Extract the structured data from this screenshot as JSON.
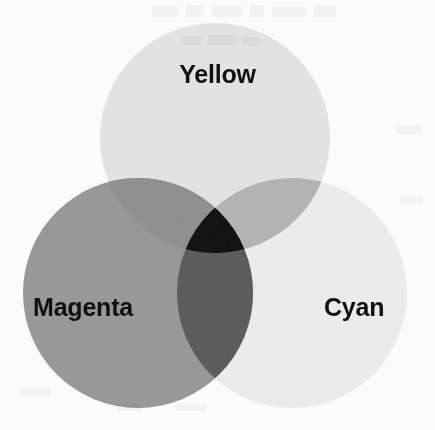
{
  "figure": {
    "type": "venn-diagram",
    "background_color": "#fbfbfb",
    "label_color": "#111111"
  },
  "labels": {
    "yellow": "Yellow",
    "magenta": "Magenta",
    "cyan": "Cyan"
  },
  "chart_data": {
    "type": "venn",
    "title": "",
    "subtitle": "",
    "xlabel": "",
    "ylabel": "",
    "grid": false,
    "legend_position": "in-figure",
    "rendering": "grayscale scan of a color figure",
    "sets": [
      {
        "id": "yellow",
        "label": "Yellow",
        "fill": "#e3e3e3",
        "center_x": 215,
        "center_y": 138,
        "radius": 115,
        "label_x": 217,
        "label_y": 74
      },
      {
        "id": "magenta",
        "label": "Magenta",
        "fill": "#989898",
        "center_x": 138,
        "center_y": 293,
        "radius": 115,
        "label_x": 95,
        "label_y": 307
      },
      {
        "id": "cyan",
        "label": "Cyan",
        "fill": "#ececec",
        "center_x": 292,
        "center_y": 293,
        "radius": 115,
        "label_x": 362,
        "label_y": 307
      }
    ],
    "regions": [
      {
        "id": "yellow-only",
        "members": [
          "yellow"
        ],
        "result": "Yellow",
        "fill": "#e3e3e3"
      },
      {
        "id": "magenta-only",
        "members": [
          "magenta"
        ],
        "result": "Magenta",
        "fill": "#989898"
      },
      {
        "id": "cyan-only",
        "members": [
          "cyan"
        ],
        "result": "Cyan",
        "fill": "#ececec"
      },
      {
        "id": "yellow-magenta",
        "members": [
          "yellow",
          "magenta"
        ],
        "result": "Red",
        "fill": "#8f8f8f"
      },
      {
        "id": "yellow-cyan",
        "members": [
          "yellow",
          "cyan"
        ],
        "result": "Green",
        "fill": "#b4b4b4"
      },
      {
        "id": "magenta-cyan",
        "members": [
          "magenta",
          "cyan"
        ],
        "result": "Blue",
        "fill": "#5a5a5a"
      },
      {
        "id": "all-three",
        "members": [
          "yellow",
          "magenta",
          "cyan"
        ],
        "result": "Black",
        "fill": "#0d0d0d"
      }
    ]
  }
}
